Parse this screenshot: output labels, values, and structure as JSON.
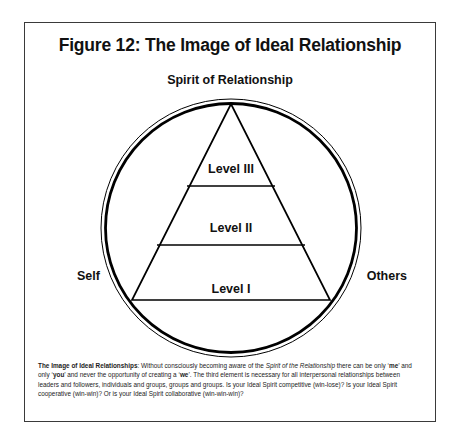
{
  "figure": {
    "title": "Figure 12: The Image of Ideal Relationship",
    "top_label": "Spirit of Relationship",
    "left_label": "Self",
    "right_label": "Others",
    "levels": [
      {
        "id": "level-3",
        "label": "Level III"
      },
      {
        "id": "level-2",
        "label": "Level II"
      },
      {
        "id": "level-1",
        "label": "Level I"
      }
    ],
    "caption": {
      "lead": "The Image of Ideal Relationships",
      "seg1": ": Without consciously becoming aware of the ",
      "em1": "Spirit of the Relationship",
      "seg2": " there can be only ‘",
      "em2": "me",
      "seg3": "’ and only ‘",
      "em3": "you",
      "seg4": "’ and never the opportunity of creating a ‘",
      "em4": "we",
      "seg5": "’. The third element is necessary for all interpersonal relationships between leaders and followers, individuals and groups, groups and groups. Is your Ideal Spirit competitive (win-lose)? Is your Ideal Spirit cooperative (win-win)?  Or is your Ideal Spirit collaborative (win-win-win)?"
    }
  },
  "colors": {
    "frame": "#3a3a3a",
    "ink": "#111111",
    "line": "#000000"
  }
}
